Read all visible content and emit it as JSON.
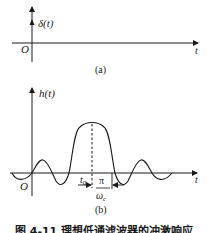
{
  "panel_a": {
    "signal_label": "δ(t)",
    "origin_label": "O",
    "axis_label": "t",
    "caption": "(a)"
  },
  "panel_b": {
    "signal_label": "h(t)",
    "origin_label": "O",
    "axis_label": "t",
    "delay_label": "t",
    "delay_subscript": "0",
    "width_numerator": "π",
    "width_denominator": "ω",
    "width_denominator_subscript": "c",
    "caption": "(b)"
  },
  "figure_caption": "图 4-11   理想低通滤波器的冲激响应",
  "colors": {
    "ink": "#1a1a1a",
    "background": "#ffffff"
  }
}
